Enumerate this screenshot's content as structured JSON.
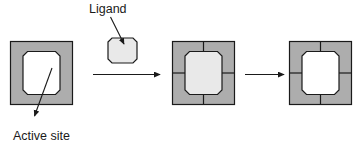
{
  "figure": {
    "type": "enzyme-substrate-binding-diagram",
    "background_color": "#ffffff",
    "labels": {
      "ligand": "Ligand",
      "active_site": "Active site"
    },
    "colors": {
      "enzyme_body": "#adadad",
      "enzyme_outline": "#1a1a1a",
      "active_site_cavity": "#ffffff",
      "ligand_fill": "#e9e9e9",
      "ligand_outline": "#1a1a1a",
      "arrow": "#1a1a1a",
      "text": "#1a1a1a"
    },
    "stages": [
      {
        "name": "free-enzyme",
        "description": "Gray square enzyme with empty white octagonal active site",
        "has_cross_lines": false,
        "cavity": "empty"
      },
      {
        "name": "enzyme-ligand-complex",
        "description": "Gray square enzyme subdivided into four quadrants with ligand bound in the central octagonal active site",
        "has_cross_lines": true,
        "cavity": "ligand-bound"
      },
      {
        "name": "enzyme-after-release",
        "description": "Gray square enzyme subdivided into four quadrants with empty white octagonal active site",
        "has_cross_lines": true,
        "cavity": "empty"
      }
    ],
    "reaction_arrows": [
      {
        "name": "arrow-1",
        "direction": "right"
      },
      {
        "name": "arrow-2",
        "direction": "right"
      }
    ],
    "pointer_lines": [
      {
        "name": "ligand-pointer",
        "from": "Ligand label",
        "to": "ligand octagon"
      },
      {
        "name": "active-site-pointer",
        "from": "active site cavity",
        "to": "Active site label"
      }
    ]
  }
}
